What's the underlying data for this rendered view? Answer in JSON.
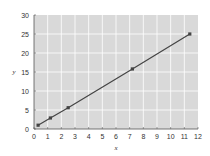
{
  "chart_data": {
    "type": "line",
    "title": "",
    "xlabel": "x",
    "ylabel": "y",
    "xlim": [
      0,
      12
    ],
    "ylim": [
      0,
      30
    ],
    "xticks": [
      0,
      1,
      2,
      3,
      4,
      5,
      6,
      7,
      8,
      9,
      10,
      11,
      12
    ],
    "yticks": [
      0,
      5,
      10,
      15,
      20,
      25,
      30
    ],
    "grid": true,
    "legend": null,
    "series": [
      {
        "name": "y",
        "x": [
          0.3,
          1.2,
          2.5,
          7.2,
          11.4
        ],
        "y": [
          1.0,
          2.9,
          5.6,
          15.8,
          25.0
        ],
        "color": "#444444",
        "markers": true
      }
    ],
    "colors": {
      "plot_background": "#d9d9d9",
      "grid": "#ffffff",
      "axis": "#555555"
    }
  }
}
